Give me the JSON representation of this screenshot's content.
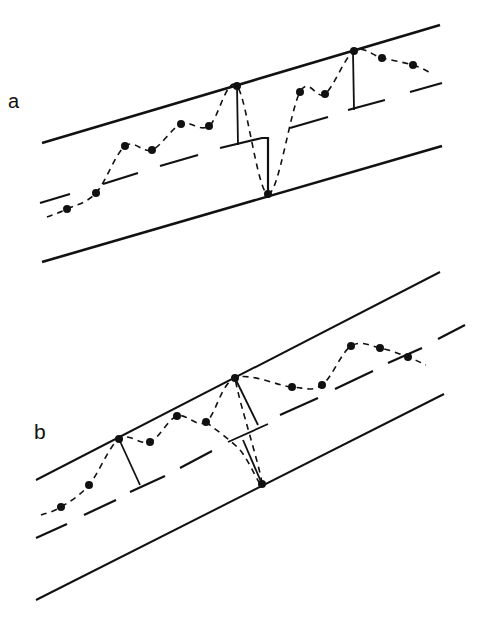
{
  "figure": {
    "panels": [
      {
        "id": "a",
        "label": "a",
        "boundaries": {
          "upper": [
            [
              42,
              143
            ],
            [
              440,
              25
            ]
          ],
          "lower": [
            [
              42,
              262
            ],
            [
              442,
              146
            ]
          ]
        },
        "centerline_dashes": [
          [
            [
              40,
              203
            ],
            [
              70,
              194
            ]
          ],
          [
            [
              103,
              184
            ],
            [
              138,
              173
            ]
          ],
          [
            [
              160,
              166
            ],
            [
              198,
              155
            ]
          ],
          [
            [
              290,
              128
            ],
            [
              328,
              117
            ]
          ],
          [
            [
              348,
              110
            ],
            [
              385,
              100
            ]
          ],
          [
            [
              410,
              92
            ],
            [
              442,
              83
            ]
          ]
        ],
        "step_path": [
          [
            220,
            148
          ],
          [
            262,
            138
          ],
          [
            268,
            138
          ],
          [
            268,
            193
          ]
        ],
        "points": [
          [
            67,
            209
          ],
          [
            96,
            193
          ],
          [
            125,
            146
          ],
          [
            152,
            150
          ],
          [
            181,
            124
          ],
          [
            209,
            126
          ],
          [
            237,
            86
          ],
          [
            268,
            194
          ],
          [
            300,
            92
          ],
          [
            325,
            94
          ],
          [
            354,
            51
          ],
          [
            382,
            58
          ],
          [
            413,
            65
          ]
        ],
        "verticals": [
          [
            [
              237,
              86
            ],
            [
              238,
              145
            ]
          ],
          [
            [
              353,
              52
            ],
            [
              354,
              110
            ]
          ]
        ]
      },
      {
        "id": "b",
        "label": "b",
        "boundaries": {
          "upper": [
            [
              36,
              480
            ],
            [
              440,
              272
            ]
          ],
          "lower": [
            [
              36,
              600
            ],
            [
              444,
              394
            ]
          ]
        },
        "centerline_dashes": [
          [
            [
              36,
              538
            ],
            [
              67,
              524
            ]
          ],
          [
            [
              84,
              515
            ],
            [
              116,
              500
            ]
          ],
          [
            [
              130,
              492
            ],
            [
              165,
              476
            ]
          ],
          [
            [
              180,
              468
            ],
            [
              212,
              451
            ]
          ],
          [
            [
              280,
              415
            ],
            [
              318,
              398
            ]
          ],
          [
            [
              335,
              389
            ],
            [
              373,
              371
            ]
          ],
          [
            [
              388,
              363
            ],
            [
              422,
              348
            ]
          ],
          [
            [
              438,
              339
            ],
            [
              465,
              325
            ]
          ]
        ],
        "step_path": [
          [
            228,
            442
          ],
          [
            268,
            424
          ]
        ],
        "points": [
          [
            61,
            507
          ],
          [
            89,
            485
          ],
          [
            119,
            439
          ],
          [
            150,
            442
          ],
          [
            177,
            416
          ],
          [
            206,
            422
          ],
          [
            235,
            378
          ],
          [
            262,
            484
          ],
          [
            292,
            387
          ],
          [
            322,
            385
          ],
          [
            351,
            346
          ],
          [
            380,
            348
          ],
          [
            408,
            357
          ]
        ],
        "verticals": [
          [
            [
              119,
              439
            ],
            [
              140,
              485
            ]
          ],
          [
            [
              235,
              378
            ],
            [
              258,
              425
            ]
          ],
          [
            [
              243,
              440
            ],
            [
              262,
              484
            ]
          ]
        ]
      }
    ],
    "colors": {
      "ink": "#111111",
      "background": "#ffffff"
    }
  }
}
